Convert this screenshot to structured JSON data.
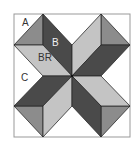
{
  "diagram": {
    "type": "quilt-block",
    "labels": [
      {
        "id": "A",
        "text": "A",
        "x": 22,
        "y": 26
      },
      {
        "id": "B",
        "text": "B",
        "x": 52,
        "y": 46
      },
      {
        "id": "BR",
        "text": "BR",
        "x": 38,
        "y": 61
      },
      {
        "id": "C",
        "text": "C",
        "x": 21,
        "y": 81
      }
    ],
    "colors": {
      "background": "#ffffff",
      "border": "#999999",
      "outline": "#2a2a2a",
      "dark": "#4a4a4a",
      "medium": "#8c8c8c",
      "light": "#c4c4c4"
    }
  }
}
